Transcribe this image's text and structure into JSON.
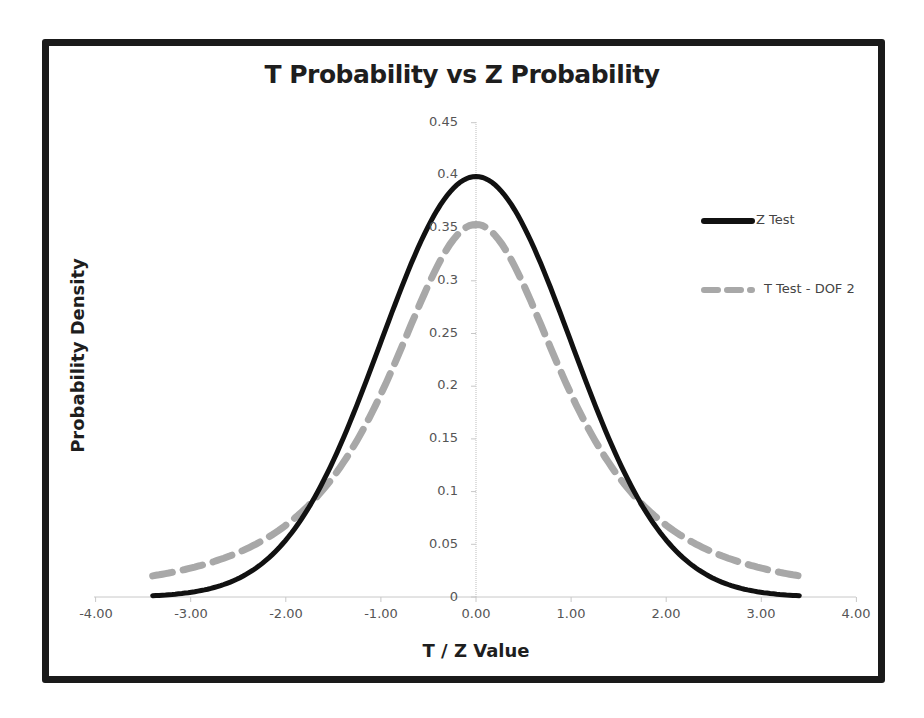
{
  "chart_data": {
    "type": "line",
    "title": "T Probability vs Z Probability",
    "xlabel": "T / Z Value",
    "ylabel": "Probability Density",
    "xlim": [
      -4,
      4
    ],
    "ylim": [
      0,
      0.45
    ],
    "x_ticks": [
      "-4.00",
      "-3.00",
      "-2.00",
      "-1.00",
      "0.00",
      "1.00",
      "2.00",
      "3.00",
      "4.00"
    ],
    "y_ticks": [
      "0",
      "0.05",
      "0.1",
      "0.15",
      "0.2",
      "0.25",
      "0.3",
      "0.35",
      "0.4",
      "0.45"
    ],
    "grid": false,
    "legend_position": "right",
    "x": [
      -3.4,
      -3.0,
      -2.5,
      -2.0,
      -1.5,
      -1.0,
      -0.5,
      0.0,
      0.5,
      1.0,
      1.5,
      2.0,
      2.5,
      3.0,
      3.4
    ],
    "series": [
      {
        "name": "Z Test",
        "style": "solid",
        "color": "#111111",
        "values": [
          0.0012,
          0.0044,
          0.0175,
          0.054,
          0.1295,
          0.242,
          0.3521,
          0.3989,
          0.3521,
          0.242,
          0.1295,
          0.054,
          0.0175,
          0.0044,
          0.0012
        ]
      },
      {
        "name": "T Test - DOF 2",
        "style": "dashed",
        "color": "#a8a8a8",
        "values": [
          0.02,
          0.0274,
          0.0422,
          0.068,
          0.1136,
          0.1925,
          0.2962,
          0.3536,
          0.2962,
          0.1925,
          0.1136,
          0.068,
          0.0422,
          0.0274,
          0.02
        ]
      }
    ]
  },
  "chart": {
    "title": "T Probability vs Z Probability",
    "xlabel": "T / Z Value",
    "ylabel": "Probability Density",
    "legend": {
      "z": "Z Test",
      "t": "T Test - DOF 2"
    },
    "x_ticks": {
      "t0": "-4.00",
      "t1": "-3.00",
      "t2": "-2.00",
      "t3": "-1.00",
      "t4": "0.00",
      "t5": "1.00",
      "t6": "2.00",
      "t7": "3.00",
      "t8": "4.00"
    },
    "y_ticks": {
      "t0": "0",
      "t1": "0.05",
      "t2": "0.1",
      "t3": "0.15",
      "t4": "0.2",
      "t5": "0.25",
      "t6": "0.3",
      "t7": "0.35",
      "t8": "0.4",
      "t9": "0.45"
    }
  }
}
